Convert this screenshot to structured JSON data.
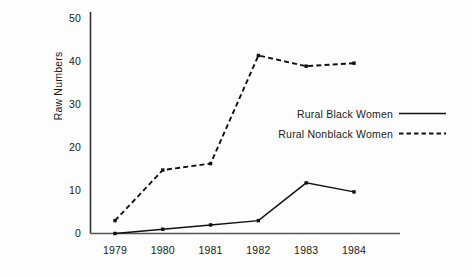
{
  "chart_data": {
    "type": "line",
    "title": "",
    "xlabel": "",
    "ylabel": "Raw Numbers",
    "categories": [
      "1979",
      "1980",
      "1981",
      "1982",
      "1983",
      "1984"
    ],
    "x": [
      1979,
      1980,
      1981,
      1982,
      1983,
      1984
    ],
    "xlim": [
      1978.6,
      1984.9
    ],
    "ylim": [
      0,
      50
    ],
    "yticks": [
      0,
      10,
      20,
      30,
      40,
      50
    ],
    "ytick_labels": [
      "0",
      "10",
      "20",
      "30",
      "40",
      "50"
    ],
    "xtick_labels": [
      "1979",
      "1980",
      "1981",
      "1982",
      "1983",
      "1984"
    ],
    "grid": false,
    "legend_position": "center-right",
    "series": [
      {
        "name": "Rural Black Women",
        "style": "solid",
        "color": "#111111",
        "marker": "square",
        "values": [
          0,
          1,
          2,
          3,
          11.8,
          9.7
        ]
      },
      {
        "name": "Rural Nonblack Women",
        "style": "dashed",
        "color": "#111111",
        "marker": "square",
        "values": [
          3,
          14.8,
          16.3,
          41.5,
          39,
          39.7
        ]
      }
    ]
  },
  "axis": {
    "y_title": "Raw Numbers"
  },
  "legend": {
    "items": [
      {
        "label": "Rural Black Women",
        "style": "solid"
      },
      {
        "label": "Rural Nonblack Women",
        "style": "dashed"
      }
    ]
  }
}
